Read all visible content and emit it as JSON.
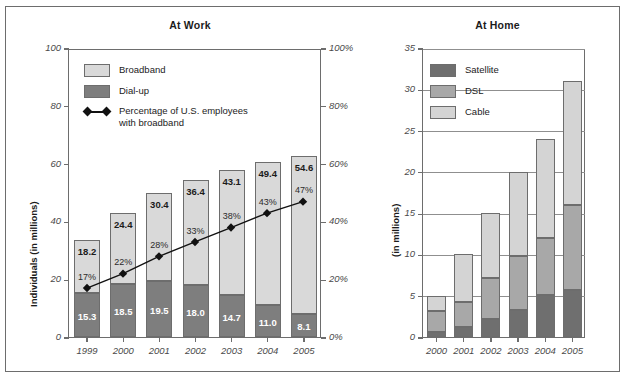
{
  "chart_data": [
    {
      "type": "bar",
      "title": "At Work",
      "xlabel": "",
      "ylabel": "Individuals (in millions)",
      "ylim": [
        0,
        100
      ],
      "yticks": [
        0,
        20,
        40,
        60,
        80,
        100
      ],
      "ytick_labels": [
        "0",
        "20",
        "40",
        "60",
        "80",
        "100"
      ],
      "y2label": "",
      "y2lim": [
        0,
        100
      ],
      "y2ticks": [
        0,
        20,
        40,
        60,
        80,
        100
      ],
      "y2tick_labels": [
        "0%",
        "20%",
        "40%",
        "60%",
        "80%",
        "100%"
      ],
      "grid": false,
      "legend_position": "upper-left",
      "stacked": true,
      "categories": [
        "1999",
        "2000",
        "2001",
        "2002",
        "2003",
        "2004",
        "2005"
      ],
      "series": [
        {
          "name": "Dial-up",
          "values": [
            15.3,
            18.5,
            19.5,
            18.0,
            14.7,
            11.0,
            8.1
          ],
          "labels": [
            "15.3",
            "18.5",
            "19.5",
            "18.0",
            "14.7",
            "11.0",
            "8.1"
          ],
          "color": "#7e7e7e"
        },
        {
          "name": "Broadband",
          "values": [
            18.2,
            24.4,
            30.4,
            36.4,
            43.1,
            49.4,
            54.6
          ],
          "labels": [
            "18.2",
            "24.4",
            "30.4",
            "36.4",
            "43.1",
            "49.4",
            "54.6"
          ],
          "color": "#d9d9d9"
        }
      ],
      "line_series": {
        "name": "Percentage of U.S. employees with broadband",
        "values": [
          17,
          22,
          28,
          33,
          38,
          43,
          47
        ],
        "labels": [
          "17%",
          "22%",
          "28%",
          "33%",
          "38%",
          "43%",
          "47%"
        ],
        "axis": "right",
        "color": "#111111",
        "marker": "diamond"
      }
    },
    {
      "type": "bar",
      "title": "At Home",
      "xlabel": "",
      "ylabel": "(in millions)",
      "ylim": [
        0,
        35
      ],
      "yticks": [
        0,
        5,
        10,
        15,
        20,
        25,
        30,
        35
      ],
      "ytick_labels": [
        "0",
        "5",
        "10",
        "15",
        "20",
        "25",
        "30",
        "35"
      ],
      "grid": true,
      "legend_position": "upper-left",
      "stacked": true,
      "categories": [
        "2000",
        "2001",
        "2002",
        "2003",
        "2004",
        "2005"
      ],
      "series": [
        {
          "name": "Satellite",
          "values": [
            0.6,
            1.2,
            2.2,
            3.3,
            5.1,
            5.7
          ],
          "color": "#6f6f6f"
        },
        {
          "name": "DSL",
          "values": [
            2.5,
            3.1,
            5.0,
            6.5,
            6.9,
            10.3
          ],
          "color": "#a8a8a8"
        },
        {
          "name": "Cable",
          "values": [
            1.9,
            5.7,
            7.8,
            10.2,
            12.0,
            15.0
          ],
          "color": "#d4d4d4"
        }
      ],
      "totals": [
        5.0,
        10.0,
        15.0,
        20.0,
        24.0,
        31.0
      ]
    }
  ],
  "work": {
    "title": "At Work",
    "ylabel": "Individuals (in millions)",
    "legend": {
      "broadband": "Broadband",
      "dialup": "Dial-up",
      "line_l1": "Percentage of U.S. employees",
      "line_l2": "with broadband"
    }
  },
  "home": {
    "title": "At Home",
    "ylabel": "(in millions)",
    "legend": {
      "satellite": "Satellite",
      "dsl": "DSL",
      "cable": "Cable"
    }
  }
}
